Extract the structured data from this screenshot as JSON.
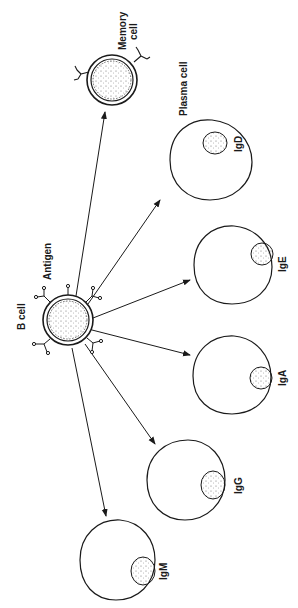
{
  "diagram": {
    "title": "",
    "orientation": "rotated-90-ccw",
    "colors": {
      "stroke": "#1a1a1a",
      "background": "#ffffff",
      "stipple": "#555555"
    },
    "source": {
      "name": "B cell",
      "label": "B cell",
      "annotation": "Antigen"
    },
    "memory_cell": {
      "label_line1": "Memory",
      "label_line2": "cell"
    },
    "plasma_header": "Plasma cell",
    "plasma_cells": [
      {
        "id": "igd",
        "label": "IgD"
      },
      {
        "id": "ige",
        "label": "IgE"
      },
      {
        "id": "iga",
        "label": "IgA"
      },
      {
        "id": "igg",
        "label": "IgG"
      },
      {
        "id": "igm",
        "label": "IgM"
      }
    ],
    "edges": [
      {
        "from": "B cell",
        "to": "Memory cell"
      },
      {
        "from": "B cell",
        "to": "IgD"
      },
      {
        "from": "B cell",
        "to": "IgE"
      },
      {
        "from": "B cell",
        "to": "IgA"
      },
      {
        "from": "B cell",
        "to": "IgG"
      },
      {
        "from": "B cell",
        "to": "IgM"
      }
    ]
  }
}
